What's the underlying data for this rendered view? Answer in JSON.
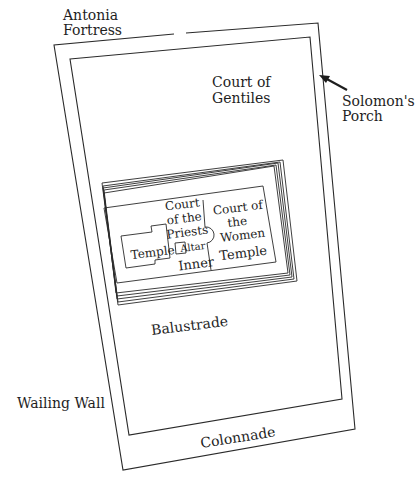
{
  "diagram": {
    "type": "plan",
    "stroke_color": "#2a2a2a",
    "text_color": "#1e1e1e",
    "background": "#ffffff",
    "labels": {
      "antonia_line1": "Antonia",
      "antonia_line2": "Fortress",
      "gentiles_line1": "Court of",
      "gentiles_line2": "Gentiles",
      "solomon_line1": "Solomon's",
      "solomon_line2": "Porch",
      "priests_line1": "Court",
      "priests_line2": "of the",
      "priests_line3": "Priests",
      "temple": "Temple",
      "altar": "Altar",
      "inner": "Inner",
      "women_line1": "Court of",
      "women_line2": "the",
      "women_line3": "Women",
      "women_temple": "Temple",
      "balustrade": "Balustrade",
      "wailing_wall": "Wailing Wall",
      "colonnade": "Colonnade"
    },
    "arrows": [
      {
        "from_label": "Solomon's Porch",
        "points_to": "outer-wall-east",
        "icon": "arrow-icon"
      }
    ]
  }
}
